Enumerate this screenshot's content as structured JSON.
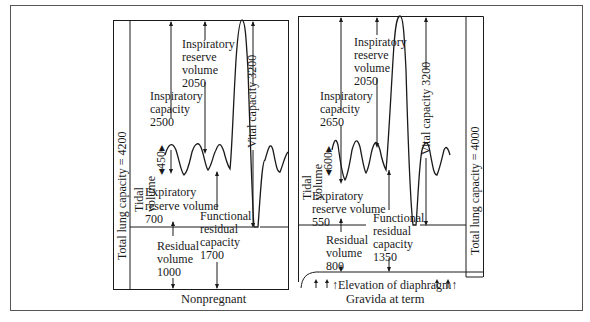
{
  "figure": {
    "border_color": "#555555",
    "line_color": "#1a1a1a"
  },
  "nonpregnant": {
    "caption": "Nonpregnant",
    "total_lung_capacity": "Total lung capacity = 4200",
    "tidal_volume_label": "Tidal",
    "tidal_volume_label2": "volume",
    "tidal_volume_value": "450",
    "inspiratory_capacity": [
      "Inspiratory",
      "capacity",
      "2500"
    ],
    "inspiratory_reserve_volume": [
      "Inspiratory",
      "reserve",
      "volume",
      "2050"
    ],
    "vital_capacity": "Vital capacity 3200",
    "expiratory_reserve_volume": [
      "Expiratory",
      "reserve  volume",
      "700"
    ],
    "functional_residual_capacity": [
      "Functional",
      "residual",
      "capacity",
      "1700"
    ],
    "residual_volume": [
      "Residual",
      "volume",
      "1000"
    ]
  },
  "gravida": {
    "caption": "Gravida at term",
    "total_lung_capacity": "Total lung capacity = 4000",
    "tidal_volume_label": "Tidal",
    "tidal_volume_label2": "volume",
    "tidal_volume_value": "600",
    "inspiratory_capacity": [
      "Inspiratory",
      "capacity",
      "2650"
    ],
    "inspiratory_reserve_volume": [
      "Inspiratory",
      "reserve",
      "volume",
      "2050"
    ],
    "vital_capacity": "Vital capacity 3200",
    "expiratory_reserve_volume": [
      "Expiratory",
      "reserve  volume",
      "550"
    ],
    "functional_residual_capacity": [
      "Functional",
      "residual",
      "capacity",
      "1350"
    ],
    "residual_volume": [
      "Residual",
      "volume",
      "800"
    ],
    "diaphragm_note": "Elevation of diaphragm"
  }
}
